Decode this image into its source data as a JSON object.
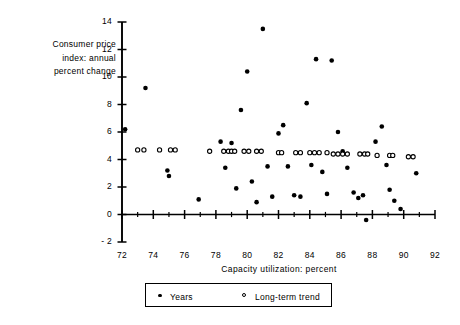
{
  "chart_data": {
    "type": "scatter",
    "title": "",
    "xlabel": "Capacity  utilization:  percent",
    "ylabel": "Consumer price\nindex: annual\npercent change",
    "xlim": [
      72,
      92
    ],
    "ylim": [
      -2,
      14
    ],
    "xticks": [
      72,
      74,
      76,
      78,
      80,
      82,
      84,
      86,
      88,
      90,
      92
    ],
    "xticklabels": [
      "72",
      "74",
      "76",
      "78",
      "80",
      "82",
      "84",
      "86",
      "88",
      "90",
      "92"
    ],
    "xminorticks": [
      73,
      75,
      77,
      79,
      81,
      83,
      85,
      87,
      89,
      91
    ],
    "yticks": [
      -2,
      0,
      2,
      4,
      6,
      8,
      10,
      12,
      14
    ],
    "yticklabels": [
      "- 2",
      "0",
      "2",
      "4",
      "6",
      "8",
      "10",
      "12",
      "14"
    ],
    "grid": false,
    "legend_position": "bottom-center",
    "series": [
      {
        "name": "Years",
        "marker": "filled-circle",
        "color": "#000000",
        "points": [
          [
            72.2,
            6.2
          ],
          [
            73.5,
            9.2
          ],
          [
            74.9,
            3.2
          ],
          [
            75.0,
            2.8
          ],
          [
            76.9,
            1.1
          ],
          [
            78.3,
            5.3
          ],
          [
            78.6,
            3.4
          ],
          [
            79.0,
            5.2
          ],
          [
            79.3,
            1.9
          ],
          [
            79.6,
            7.6
          ],
          [
            80.0,
            10.4
          ],
          [
            80.3,
            2.4
          ],
          [
            80.6,
            0.9
          ],
          [
            81.0,
            13.5
          ],
          [
            81.3,
            3.5
          ],
          [
            81.6,
            1.3
          ],
          [
            82.0,
            5.9
          ],
          [
            82.3,
            6.5
          ],
          [
            82.6,
            3.5
          ],
          [
            83.0,
            1.4
          ],
          [
            83.4,
            1.3
          ],
          [
            83.8,
            8.1
          ],
          [
            84.1,
            3.6
          ],
          [
            84.4,
            11.3
          ],
          [
            84.8,
            3.1
          ],
          [
            85.1,
            1.5
          ],
          [
            85.4,
            11.2
          ],
          [
            85.8,
            6.0
          ],
          [
            86.1,
            4.6
          ],
          [
            86.4,
            3.4
          ],
          [
            86.8,
            1.6
          ],
          [
            87.1,
            1.2
          ],
          [
            87.4,
            1.4
          ],
          [
            87.6,
            -0.4
          ],
          [
            88.2,
            5.3
          ],
          [
            88.6,
            6.4
          ],
          [
            88.9,
            3.6
          ],
          [
            89.1,
            1.8
          ],
          [
            89.4,
            1.0
          ],
          [
            89.8,
            0.4
          ],
          [
            90.8,
            3.0
          ]
        ]
      },
      {
        "name": "Long-term  trend",
        "marker": "open-circle",
        "color": "#000000",
        "points": [
          [
            73.0,
            4.7
          ],
          [
            73.4,
            4.7
          ],
          [
            74.4,
            4.7
          ],
          [
            75.1,
            4.7
          ],
          [
            75.4,
            4.7
          ],
          [
            77.6,
            4.6
          ],
          [
            78.5,
            4.6
          ],
          [
            78.8,
            4.6
          ],
          [
            79.0,
            4.6
          ],
          [
            79.2,
            4.6
          ],
          [
            79.8,
            4.6
          ],
          [
            80.1,
            4.6
          ],
          [
            80.6,
            4.6
          ],
          [
            80.9,
            4.6
          ],
          [
            82.0,
            4.5
          ],
          [
            82.2,
            4.5
          ],
          [
            83.1,
            4.5
          ],
          [
            83.4,
            4.5
          ],
          [
            84.0,
            4.5
          ],
          [
            84.3,
            4.5
          ],
          [
            84.6,
            4.5
          ],
          [
            85.1,
            4.5
          ],
          [
            85.5,
            4.4
          ],
          [
            85.8,
            4.4
          ],
          [
            86.1,
            4.4
          ],
          [
            86.4,
            4.4
          ],
          [
            87.2,
            4.4
          ],
          [
            87.5,
            4.4
          ],
          [
            87.7,
            4.4
          ],
          [
            88.3,
            4.3
          ],
          [
            89.1,
            4.3
          ],
          [
            89.3,
            4.3
          ],
          [
            90.3,
            4.2
          ],
          [
            90.6,
            4.2
          ]
        ]
      }
    ]
  },
  "legend": {
    "entries": [
      {
        "label": "Years",
        "marker": "filled-circle"
      },
      {
        "label": "Long-term  trend",
        "marker": "open-circle"
      }
    ]
  }
}
